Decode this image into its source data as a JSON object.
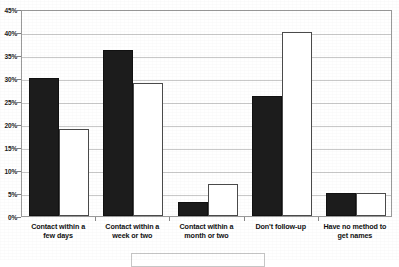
{
  "chart_data": {
    "type": "bar",
    "title": "",
    "subtitle": "",
    "xlabel": "",
    "ylabel": "",
    "ylim": [
      0,
      45
    ],
    "ytick_step": 5,
    "ytick_labels": [
      "0%",
      "5%",
      "10%",
      "15%",
      "20%",
      "25%",
      "30%",
      "35%",
      "40%",
      "45%"
    ],
    "ytick_values": [
      0,
      5,
      10,
      15,
      20,
      25,
      30,
      35,
      40,
      45
    ],
    "grid": true,
    "legend_position": "bottom",
    "categories": [
      "Contact within a few days",
      "Contact within a week or two",
      "Contact within a month or two",
      "Don't follow-up",
      "Have no method to get names"
    ],
    "category_lines": [
      [
        "Contact within a",
        "few days"
      ],
      [
        "Contact within a",
        "week or two"
      ],
      [
        "Contact within a",
        "month or two"
      ],
      [
        "Don't follow-up",
        ""
      ],
      [
        "Have no method to",
        "get names"
      ]
    ],
    "series": [
      {
        "name": "Series 1",
        "fill": "#1c1c1c",
        "values": [
          30,
          36,
          3,
          26,
          5
        ]
      },
      {
        "name": "Series 2",
        "fill": "#ffffff",
        "values": [
          19,
          29,
          7,
          40,
          5
        ]
      }
    ]
  },
  "colors": {
    "series_dark": "#1c1c1c",
    "series_light": "#ffffff",
    "bar_outline": "#4a4a4a",
    "gridline": "#c9c9c9",
    "plot_border": "#9a9a9a",
    "text": "#111111",
    "background": "#ffffff"
  }
}
